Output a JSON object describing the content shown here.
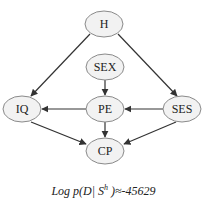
{
  "diagram": {
    "type": "bayesian-network",
    "nodes": [
      {
        "id": "H",
        "label": "H",
        "cx": 104,
        "cy": 24
      },
      {
        "id": "SEX",
        "label": "SEX",
        "cx": 105,
        "cy": 67
      },
      {
        "id": "IQ",
        "label": "IQ",
        "cx": 22,
        "cy": 109
      },
      {
        "id": "PE",
        "label": "PE",
        "cx": 105,
        "cy": 109
      },
      {
        "id": "SES",
        "label": "SES",
        "cx": 182,
        "cy": 109
      },
      {
        "id": "CP",
        "label": "CP",
        "cx": 105,
        "cy": 151
      }
    ],
    "edges": [
      {
        "from": "H",
        "to": "IQ"
      },
      {
        "from": "H",
        "to": "SES"
      },
      {
        "from": "SEX",
        "to": "PE"
      },
      {
        "from": "PE",
        "to": "IQ"
      },
      {
        "from": "SES",
        "to": "PE"
      },
      {
        "from": "IQ",
        "to": "CP"
      },
      {
        "from": "PE",
        "to": "CP"
      },
      {
        "from": "SES",
        "to": "CP"
      }
    ],
    "caption": {
      "prefix": "Log p(D| S",
      "superscript": "h",
      "suffix": " )≈-45629"
    }
  }
}
